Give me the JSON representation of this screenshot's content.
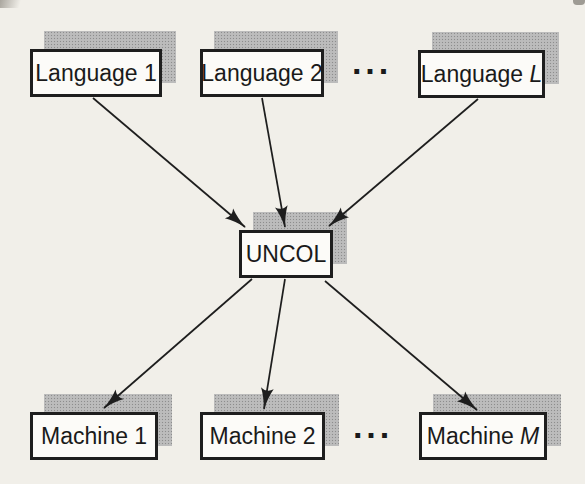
{
  "diagram": {
    "nodes": {
      "language_1": {
        "base": "Language",
        "var": "1"
      },
      "language_2": {
        "base": "Language",
        "var": "2"
      },
      "language_l": {
        "base": "Language",
        "var": "L"
      },
      "uncol": {
        "label": "UNCOL"
      },
      "machine_1": {
        "base": "Machine",
        "var": "1"
      },
      "machine_2": {
        "base": "Machine",
        "var": "2"
      },
      "machine_m": {
        "base": "Machine",
        "var": "M"
      }
    },
    "ellipsis_top": "···",
    "ellipsis_bottom": "···",
    "edges": [
      {
        "from": "language_1",
        "to": "uncol"
      },
      {
        "from": "language_2",
        "to": "uncol"
      },
      {
        "from": "language_l",
        "to": "uncol"
      },
      {
        "from": "uncol",
        "to": "machine_1"
      },
      {
        "from": "uncol",
        "to": "machine_2"
      },
      {
        "from": "uncol",
        "to": "machine_m"
      }
    ],
    "colors": {
      "background": "#f1efe9",
      "box_fill": "#fcfbf8",
      "box_border": "#1e1e1e",
      "arrow": "#1e1e1e",
      "text": "#1a1a1a",
      "shadow_dot": "#8d8d8d",
      "shadow_base": "#dedede"
    }
  }
}
